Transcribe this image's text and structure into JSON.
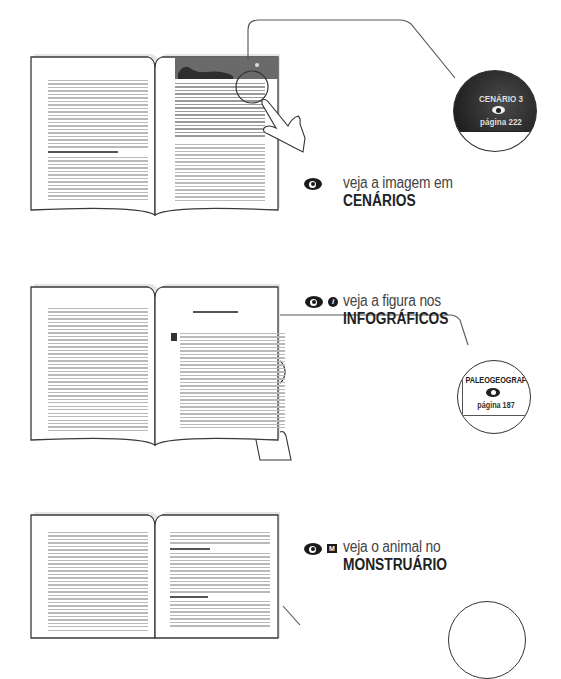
{
  "sections": [
    {
      "id": "cenarios",
      "label_line1": "veja a imagem em",
      "label_line2": "CENÁRIOS",
      "icons": [
        "eye-icon"
      ],
      "bubble": {
        "title": "CENÁRIO 3",
        "icon": "eye-icon",
        "page": "página 222",
        "style": "dark"
      }
    },
    {
      "id": "infograficos",
      "label_line1": "veja a figura nos",
      "label_line2": "INFOGRÁFICOS",
      "icons": [
        "eye-icon",
        "info-icon"
      ],
      "bubble": {
        "title": "PALEOGEOGRAFIA",
        "icon": "eye-icon",
        "page": "página 187",
        "style": "light"
      }
    },
    {
      "id": "monstruario",
      "label_line1": "veja o animal no",
      "label_line2": "MONSTRUÁRIO",
      "icons": [
        "eye-icon",
        "monstruario-m-icon"
      ],
      "bubble": {
        "style": "light"
      }
    }
  ],
  "icon_glyphs": {
    "info": "i",
    "monstruario": "M"
  },
  "colors": {
    "ink": "#222222",
    "text": "#444444",
    "page_outline": "#3a3a3a",
    "text_lines": "#b9b9b9",
    "bubble_dark": "#2a2a2a"
  }
}
